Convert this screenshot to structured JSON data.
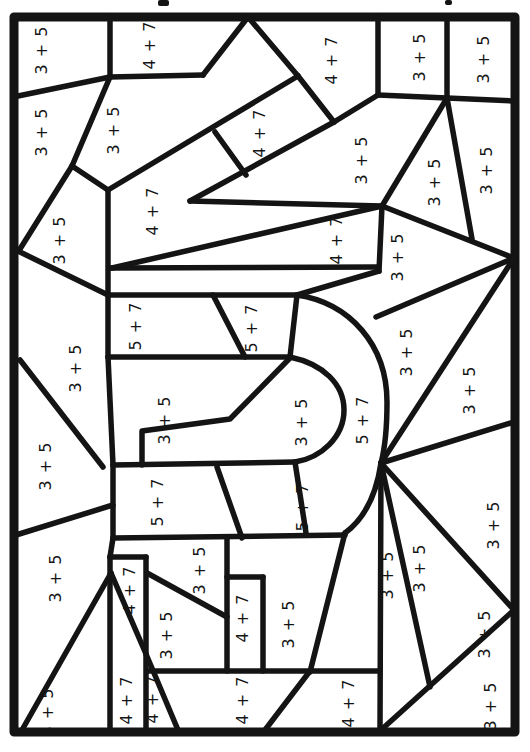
{
  "worksheet": {
    "width": 530,
    "height": 752,
    "background_color": "#ffffff",
    "ink_color": "#141414",
    "border": {
      "x": 14,
      "y": 17,
      "w": 501,
      "h": 715,
      "stroke_width": 9
    },
    "inner_stroke_width": 5.5,
    "label_rotation_deg": -90,
    "expressions": {
      "sum8": "3 + 5",
      "sum11": "4 + 7",
      "sum12": "5 + 7"
    },
    "title_fragments": [
      {
        "x": 158,
        "y": 0,
        "w": 11,
        "h": 6
      },
      {
        "x": 445,
        "y": 0,
        "w": 7,
        "h": 5
      }
    ],
    "regions": [
      {
        "label": "3 + 5",
        "x": 42,
        "y": 50
      },
      {
        "label": "4 + 7",
        "x": 150,
        "y": 45
      },
      {
        "label": "4 + 7",
        "x": 332,
        "y": 60
      },
      {
        "label": "3 + 5",
        "x": 420,
        "y": 57
      },
      {
        "label": "3 + 5",
        "x": 484,
        "y": 59
      },
      {
        "label": "3 + 5",
        "x": 42,
        "y": 132
      },
      {
        "label": "3 + 5",
        "x": 114,
        "y": 130
      },
      {
        "label": "4 + 7",
        "x": 260,
        "y": 133
      },
      {
        "label": "4 + 7",
        "x": 153,
        "y": 211
      },
      {
        "label": "3 + 5",
        "x": 362,
        "y": 160
      },
      {
        "label": "3 + 5",
        "x": 435,
        "y": 182
      },
      {
        "label": "3 + 5",
        "x": 487,
        "y": 170
      },
      {
        "label": "4 + 7",
        "x": 337,
        "y": 240
      },
      {
        "label": "3 + 5",
        "x": 398,
        "y": 257
      },
      {
        "label": "3 + 5",
        "x": 60,
        "y": 240
      },
      {
        "label": "3 + 5",
        "x": 76,
        "y": 368
      },
      {
        "label": "5 + 7",
        "x": 136,
        "y": 326
      },
      {
        "label": "5 + 7",
        "x": 252,
        "y": 328
      },
      {
        "label": "3 + 5",
        "x": 407,
        "y": 352
      },
      {
        "label": "5 + 7",
        "x": 363,
        "y": 420
      },
      {
        "label": "3 + 5",
        "x": 302,
        "y": 422
      },
      {
        "label": "3 + 5",
        "x": 165,
        "y": 420
      },
      {
        "label": "3 + 5",
        "x": 470,
        "y": 390
      },
      {
        "label": "3 + 5",
        "x": 46,
        "y": 466
      },
      {
        "label": "5 + 7",
        "x": 158,
        "y": 502
      },
      {
        "label": "5 + 7",
        "x": 303,
        "y": 507
      },
      {
        "label": "3 + 5",
        "x": 494,
        "y": 525
      },
      {
        "label": "3 + 5",
        "x": 56,
        "y": 578
      },
      {
        "label": "3 + 5",
        "x": 200,
        "y": 570
      },
      {
        "label": "3 + 5",
        "x": 388,
        "y": 575
      },
      {
        "label": "3 + 5",
        "x": 420,
        "y": 568
      },
      {
        "label": "4 + 7",
        "x": 130,
        "y": 590
      },
      {
        "label": "4 + 7",
        "x": 243,
        "y": 618
      },
      {
        "label": "3 + 5",
        "x": 289,
        "y": 624
      },
      {
        "label": "3 + 5",
        "x": 167,
        "y": 635
      },
      {
        "label": "3 + 5",
        "x": 485,
        "y": 634
      },
      {
        "label": "4 + 7",
        "x": 127,
        "y": 700
      },
      {
        "label": "4 + 7",
        "x": 153,
        "y": 699
      },
      {
        "label": "4 + 7",
        "x": 243,
        "y": 700
      },
      {
        "label": "4 + 7",
        "x": 349,
        "y": 703
      },
      {
        "label": "3 + 5",
        "x": 48,
        "y": 712
      },
      {
        "label": "3 + 5",
        "x": 491,
        "y": 706
      }
    ],
    "lines": [
      [
        110,
        17,
        110,
        77
      ],
      [
        110,
        77,
        203,
        75
      ],
      [
        203,
        75,
        248,
        17
      ],
      [
        248,
        17,
        298,
        76
      ],
      [
        110,
        77,
        18,
        96
      ],
      [
        110,
        77,
        72,
        166
      ],
      [
        72,
        166,
        20,
        249
      ],
      [
        72,
        166,
        108,
        190
      ],
      [
        108,
        190,
        298,
        76
      ],
      [
        298,
        76,
        334,
        122
      ],
      [
        334,
        122,
        378,
        95
      ],
      [
        378,
        17,
        378,
        95
      ],
      [
        378,
        95,
        447,
        98
      ],
      [
        447,
        17,
        447,
        98
      ],
      [
        447,
        98,
        513,
        101
      ],
      [
        215,
        132,
        246,
        175
      ],
      [
        334,
        122,
        190,
        201
      ],
      [
        190,
        201,
        382,
        206
      ],
      [
        108,
        190,
        108,
        295
      ],
      [
        110,
        268,
        377,
        267
      ],
      [
        112,
        268,
        382,
        206
      ],
      [
        447,
        98,
        382,
        206
      ],
      [
        382,
        206,
        514,
        258
      ],
      [
        447,
        98,
        472,
        239
      ],
      [
        382,
        206,
        379,
        271
      ],
      [
        379,
        271,
        297,
        295
      ],
      [
        514,
        258,
        376,
        317
      ],
      [
        20,
        252,
        108,
        295
      ],
      [
        20,
        360,
        103,
        467
      ],
      [
        16,
        535,
        113,
        505
      ],
      [
        297,
        295,
        290,
        357
      ],
      [
        295,
        462,
        306,
        533
      ],
      [
        213,
        295,
        245,
        357
      ],
      [
        108,
        295,
        297,
        295
      ],
      [
        108,
        357,
        290,
        357
      ],
      [
        108,
        295,
        108,
        357
      ],
      [
        108,
        357,
        113,
        465
      ],
      [
        113,
        465,
        295,
        462
      ],
      [
        113,
        538,
        345,
        535
      ],
      [
        113,
        465,
        113,
        538
      ],
      [
        217,
        467,
        242,
        538
      ],
      [
        22,
        730,
        111,
        573
      ],
      [
        111,
        573,
        146,
        654
      ],
      [
        146,
        654,
        178,
        730
      ],
      [
        110,
        557,
        110,
        730
      ],
      [
        146,
        557,
        146,
        730
      ],
      [
        110,
        557,
        146,
        557
      ],
      [
        113,
        538,
        110,
        557
      ],
      [
        147,
        573,
        227,
        617
      ],
      [
        148,
        671,
        380,
        671
      ],
      [
        227,
        538,
        227,
        671
      ],
      [
        227,
        577,
        263,
        577
      ],
      [
        263,
        577,
        263,
        671
      ],
      [
        345,
        533,
        310,
        672
      ],
      [
        310,
        671,
        265,
        730
      ],
      [
        381,
        463,
        380,
        730
      ],
      [
        381,
        730,
        514,
        610
      ],
      [
        381,
        463,
        514,
        610
      ],
      [
        381,
        463,
        430,
        687
      ],
      [
        381,
        463,
        514,
        422
      ],
      [
        381,
        463,
        514,
        258
      ]
    ],
    "polylines": [
      [
        290,
        358,
        230,
        419,
        142,
        431,
        142,
        465
      ]
    ],
    "curves": [
      "M297,295 C350,303 387,345 387,402 C387,432 385,448 381,463 C376,497 364,519 345,533",
      "M290,357 C323,364 344,384 344,410 C344,437 321,458 295,462"
    ]
  }
}
